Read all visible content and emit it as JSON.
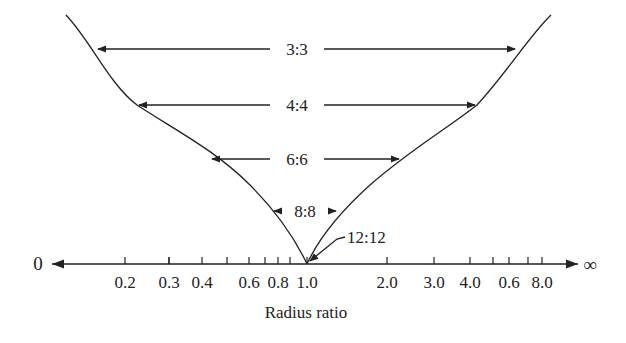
{
  "diagram": {
    "title": "",
    "x_axis": {
      "label": "Radius ratio",
      "left_end": "0",
      "right_end": "∞",
      "ticks": [
        {
          "x": 125,
          "label": "0.2"
        },
        {
          "x": 169,
          "label": ""
        },
        {
          "x": 169,
          "label": "0.3"
        },
        {
          "x": 202,
          "label": "0.4"
        },
        {
          "x": 227,
          "label": ""
        },
        {
          "x": 249,
          "label": "0.6"
        },
        {
          "x": 265,
          "label": ""
        },
        {
          "x": 278,
          "label": "0.8"
        },
        {
          "x": 290,
          "label": ""
        },
        {
          "x": 307,
          "label": "1.0"
        },
        {
          "x": 387,
          "label": "2.0"
        },
        {
          "x": 434,
          "label": "3.0"
        },
        {
          "x": 470,
          "label": "4.0"
        },
        {
          "x": 493,
          "label": ""
        },
        {
          "x": 509,
          "label": "0.6"
        },
        {
          "x": 528,
          "label": ""
        },
        {
          "x": 542,
          "label": "8.0"
        }
      ]
    },
    "coordination_bands": [
      {
        "label": "3:3",
        "y": 49,
        "x_left": 96,
        "x_right": 517
      },
      {
        "label": "4:4",
        "y": 105,
        "x_left": 137,
        "x_right": 477
      },
      {
        "label": "6:6",
        "y": 159,
        "x_left": 210,
        "x_right": 401
      },
      {
        "label": "8:8",
        "y": 211,
        "x_left": 272,
        "x_right": 338
      },
      {
        "label": "12:12",
        "y": 264,
        "x_point": 307
      }
    ],
    "colors": {
      "line": "#222222",
      "background": "#ffffff"
    }
  }
}
